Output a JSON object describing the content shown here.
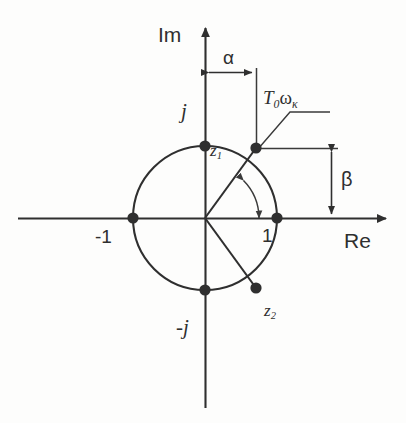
{
  "figure": {
    "kind": "z-plane-unit-circle-diagram",
    "background_color": "#fdfdfc",
    "ink_color": "#2f2f2f"
  },
  "axes": {
    "imaginary_label": "Im",
    "real_label": "Re",
    "origin": {
      "x": 205,
      "y": 218
    },
    "real_axis": {
      "x1": 18,
      "x2": 392,
      "y": 218
    },
    "imaginary_axis": {
      "y1": 22,
      "y2": 408,
      "x": 205
    }
  },
  "unit_circle": {
    "center_x": 205,
    "center_y": 218,
    "radius": 72
  },
  "points": [
    {
      "name": "j",
      "label": "j",
      "x": 205,
      "y": 146
    },
    {
      "name": "-j",
      "label": "-j",
      "x": 205,
      "y": 290
    },
    {
      "name": "-1",
      "label": "-1",
      "x": 133,
      "y": 218
    },
    {
      "name": "1",
      "label": "1",
      "x": 277,
      "y": 218
    },
    {
      "name": "z1",
      "label": "z",
      "label_sub": "1",
      "x": 256,
      "y": 148
    },
    {
      "name": "z2",
      "label": "z",
      "label_sub": "2",
      "x": 256,
      "y": 288
    }
  ],
  "dimensions": {
    "alpha": {
      "label": "α",
      "orientation": "horizontal",
      "y": 72,
      "x_start": 205,
      "x_end": 256,
      "meaning": "horizontal offset of z1 from imaginary axis"
    },
    "beta": {
      "label": "β",
      "orientation": "vertical",
      "x": 331,
      "y_start": 148,
      "y_end": 218,
      "meaning": "vertical offset of z1 from real axis"
    }
  },
  "annotation": {
    "label_main": "T",
    "label_sub_0": "0",
    "label_omega": "ω",
    "label_sub_k": "κ",
    "full_text": "T₀ωκ",
    "leader_target": {
      "x": 256,
      "y": 148
    }
  },
  "angle_arc": {
    "from_deg": 0,
    "to_deg": 44,
    "radius": 54,
    "double_headed": true
  },
  "radii": [
    {
      "from": "origin",
      "to": "z1"
    },
    {
      "from": "origin",
      "to": "z2"
    }
  ]
}
